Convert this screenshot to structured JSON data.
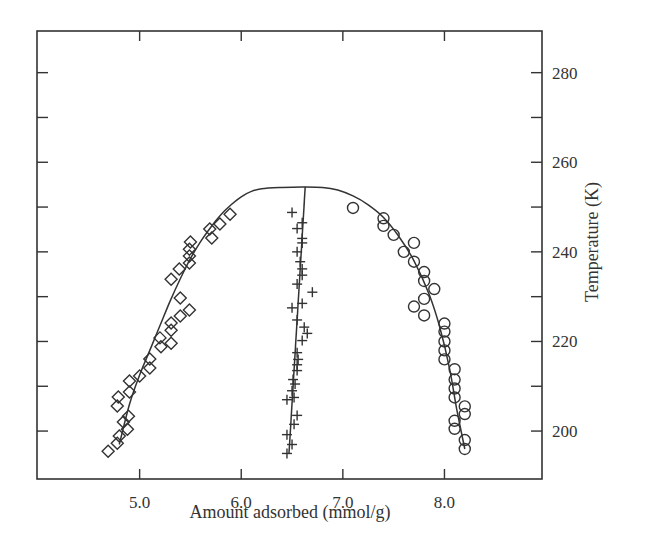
{
  "chart_data": {
    "type": "scatter",
    "title": "",
    "xlabel": "Amount adsorbed (mmol/g)",
    "ylabel": "Temperature (K)",
    "xlim": [
      3.99,
      8.96
    ],
    "ylim": [
      189.3,
      289.3
    ],
    "x_ticks": [
      5.0,
      6.0,
      7.0,
      8.0
    ],
    "x_tick_labels": [
      "5.0",
      "6.0",
      "7.0",
      "8.0"
    ],
    "x_minor_ticks_top": [
      5.0,
      6.0,
      7.0,
      8.0
    ],
    "y_ticks": [
      200,
      210,
      220,
      230,
      240,
      250,
      260,
      270,
      280
    ],
    "y_tick_labels": [
      "200",
      "",
      "220",
      "",
      "240",
      "",
      "260",
      "",
      "280"
    ],
    "y_axis_side": "right",
    "grid": false,
    "legend": null,
    "series": [
      {
        "name": "diamonds",
        "marker": "diamond",
        "points": [
          [
            4.69,
            195.5
          ],
          [
            4.78,
            197.3
          ],
          [
            4.8,
            198.9
          ],
          [
            4.88,
            200.4
          ],
          [
            4.84,
            202.0
          ],
          [
            4.89,
            203.3
          ],
          [
            4.78,
            205.6
          ],
          [
            4.79,
            207.6
          ],
          [
            4.9,
            208.7
          ],
          [
            4.9,
            211.2
          ],
          [
            5.0,
            212.3
          ],
          [
            5.1,
            214.1
          ],
          [
            5.1,
            216.1
          ],
          [
            5.21,
            218.8
          ],
          [
            5.31,
            219.6
          ],
          [
            5.2,
            220.8
          ],
          [
            5.31,
            222.5
          ],
          [
            5.31,
            224.1
          ],
          [
            5.4,
            225.7
          ],
          [
            5.49,
            227.0
          ],
          [
            5.4,
            229.7
          ],
          [
            5.31,
            233.9
          ],
          [
            5.39,
            236.2
          ],
          [
            5.49,
            237.5
          ],
          [
            5.49,
            239.1
          ],
          [
            5.49,
            240.6
          ],
          [
            5.5,
            242.2
          ],
          [
            5.71,
            243.1
          ],
          [
            5.69,
            245.1
          ],
          [
            5.79,
            246.2
          ],
          [
            5.89,
            248.4
          ]
        ]
      },
      {
        "name": "crosses",
        "marker": "plus",
        "points": [
          [
            6.45,
            195.0
          ],
          [
            6.5,
            197.0
          ],
          [
            6.45,
            199.2
          ],
          [
            6.52,
            201.5
          ],
          [
            6.55,
            203.5
          ],
          [
            6.45,
            207.0
          ],
          [
            6.52,
            207.5
          ],
          [
            6.5,
            209.0
          ],
          [
            6.53,
            210.5
          ],
          [
            6.51,
            211.5
          ],
          [
            6.55,
            213.5
          ],
          [
            6.55,
            214.8
          ],
          [
            6.56,
            216.0
          ],
          [
            6.55,
            217.5
          ],
          [
            6.6,
            220.2
          ],
          [
            6.65,
            221.8
          ],
          [
            6.62,
            223.2
          ],
          [
            6.55,
            224.8
          ],
          [
            6.5,
            227.5
          ],
          [
            6.6,
            228.5
          ],
          [
            6.7,
            231.0
          ],
          [
            6.55,
            232.8
          ],
          [
            6.6,
            234.8
          ],
          [
            6.6,
            236.2
          ],
          [
            6.58,
            237.8
          ],
          [
            6.55,
            240.0
          ],
          [
            6.6,
            242.0
          ],
          [
            6.6,
            243.0
          ],
          [
            6.55,
            245.2
          ],
          [
            6.6,
            246.5
          ],
          [
            6.5,
            248.8
          ]
        ]
      },
      {
        "name": "circles",
        "marker": "circle",
        "points": [
          [
            7.1,
            249.8
          ],
          [
            7.4,
            247.5
          ],
          [
            7.4,
            245.8
          ],
          [
            7.5,
            243.8
          ],
          [
            7.6,
            240.0
          ],
          [
            7.7,
            242.0
          ],
          [
            7.7,
            237.8
          ],
          [
            7.8,
            235.5
          ],
          [
            7.8,
            233.5
          ],
          [
            7.9,
            231.7
          ],
          [
            7.8,
            229.5
          ],
          [
            7.7,
            227.8
          ],
          [
            7.8,
            225.8
          ],
          [
            8.0,
            224.0
          ],
          [
            8.0,
            222.2
          ],
          [
            8.0,
            220.0
          ],
          [
            8.0,
            218.0
          ],
          [
            8.0,
            216.0
          ],
          [
            8.1,
            213.8
          ],
          [
            8.1,
            211.5
          ],
          [
            8.1,
            209.5
          ],
          [
            8.1,
            207.5
          ],
          [
            8.2,
            205.5
          ],
          [
            8.2,
            203.8
          ],
          [
            8.1,
            202.3
          ],
          [
            8.1,
            200.5
          ],
          [
            8.2,
            198.0
          ],
          [
            8.2,
            196.0
          ]
        ]
      }
    ],
    "fit_curves": [
      {
        "name": "coexistence-envelope",
        "points": [
          [
            4.8,
            197.0
          ],
          [
            4.9,
            206.0
          ],
          [
            5.0,
            212.5
          ],
          [
            5.1,
            218.0
          ],
          [
            5.2,
            223.5
          ],
          [
            5.3,
            229.0
          ],
          [
            5.4,
            234.0
          ],
          [
            5.5,
            238.5
          ],
          [
            5.6,
            242.3
          ],
          [
            5.7,
            245.5
          ],
          [
            5.8,
            248.3
          ],
          [
            5.9,
            250.5
          ],
          [
            6.0,
            252.3
          ],
          [
            6.1,
            253.5
          ],
          [
            6.2,
            254.1
          ],
          [
            6.4,
            254.4
          ],
          [
            6.6,
            254.5
          ],
          [
            6.8,
            254.4
          ],
          [
            6.95,
            253.8
          ],
          [
            7.1,
            252.5
          ],
          [
            7.25,
            250.5
          ],
          [
            7.4,
            247.7
          ],
          [
            7.55,
            243.5
          ],
          [
            7.7,
            238.0
          ],
          [
            7.85,
            230.5
          ],
          [
            7.95,
            223.5
          ],
          [
            8.05,
            214.0
          ],
          [
            8.12,
            205.0
          ],
          [
            8.2,
            196.0
          ]
        ]
      },
      {
        "name": "rectilinear-diameter",
        "points": [
          [
            6.47,
            195.0
          ],
          [
            6.63,
            254.5
          ]
        ]
      }
    ]
  }
}
